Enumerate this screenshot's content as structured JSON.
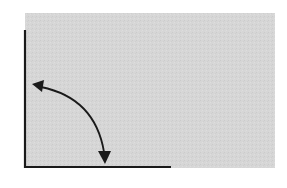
{
  "diagram": {
    "colors": {
      "background": "#ffffff",
      "panel_fill": "#d6d6d6",
      "line_color": "#1a1a1a"
    },
    "elements": {
      "panel": "gray-panel",
      "vertical_edge": "vertical-edge-line",
      "horizontal_edge": "horizontal-edge-line",
      "arrow": "double-headed-curved-arrow"
    },
    "rotation_angle_degrees": 90
  }
}
